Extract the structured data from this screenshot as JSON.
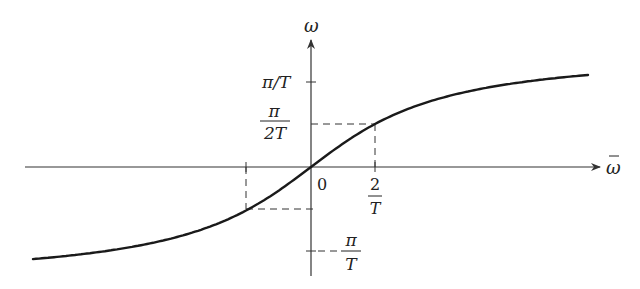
{
  "diagram": {
    "type": "function-plot",
    "axes": {
      "vertical_label": "ω",
      "horizontal_label": "ω̄",
      "origin_label": "0"
    },
    "y_ticks": [
      {
        "label": "π/T",
        "value": "π/T"
      },
      {
        "label_num": "π",
        "label_den": "2T",
        "value": "π/(2T)"
      },
      {
        "label_prefix": "−",
        "label_num": "π",
        "label_den": "T",
        "value": "−π/T"
      }
    ],
    "x_ticks": [
      {
        "label_num": "2",
        "label_den": "T",
        "value": "2/T"
      }
    ],
    "colors": {
      "curve": "#1a1a1a",
      "axes": "#333333",
      "dashed": "#333333",
      "background": "#ffffff"
    }
  },
  "labels": {
    "omega": "ω",
    "omega_bar": "ω",
    "zero": "0",
    "pi_over_T": "π/T",
    "pi": "π",
    "two_T": "2T",
    "two": "2",
    "T": "T",
    "minus": "−"
  }
}
